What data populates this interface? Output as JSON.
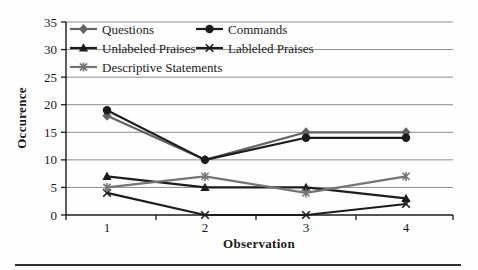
{
  "figure": {
    "background": "#fefefe",
    "bottom_rule_color": "#2e2e2e",
    "axis_color": "#1a1a1a",
    "gridline_color": "#8c8c8c"
  },
  "chart_data": {
    "type": "line",
    "title": "",
    "xlabel": "Observation",
    "ylabel": "Occurence",
    "x": [
      1,
      2,
      3,
      4
    ],
    "xtick_labels": [
      "1",
      "2",
      "3",
      "4"
    ],
    "yticks": [
      0,
      5,
      10,
      15,
      20,
      25,
      30,
      35
    ],
    "ytick_labels": [
      "0",
      "5",
      "10",
      "15",
      "20",
      "25",
      "30",
      "35"
    ],
    "ylim": [
      0,
      35
    ],
    "grid": "horizontal",
    "legend_position": "inside-top-left, two columns",
    "series": [
      {
        "name": "Questions",
        "marker": "diamond",
        "color": "#636363",
        "values": [
          18,
          10,
          15,
          15
        ]
      },
      {
        "name": "Commands",
        "marker": "circle",
        "color": "#1c1c1c",
        "values": [
          19,
          10,
          14,
          14
        ]
      },
      {
        "name": "Unlabeled Praises",
        "marker": "triangle",
        "color": "#1c1c1c",
        "values": [
          7,
          5,
          5,
          3
        ]
      },
      {
        "name": "Lableled Praises",
        "marker": "x",
        "color": "#1c1c1c",
        "values": [
          4,
          0,
          0,
          2
        ]
      },
      {
        "name": "Descriptive Statements",
        "marker": "asterisk",
        "color": "#757575",
        "values": [
          5,
          7,
          4,
          7
        ]
      }
    ]
  }
}
